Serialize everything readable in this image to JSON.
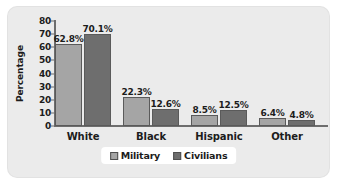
{
  "chart_data": {
    "type": "bar",
    "title": "",
    "xlabel": "",
    "ylabel": "Percentage",
    "ylim": [
      0,
      80
    ],
    "yticks": [
      80,
      70,
      60,
      50,
      40,
      30,
      20,
      10,
      0
    ],
    "grid": false,
    "legend_position": "bottom",
    "categories": [
      "White",
      "Black",
      "Hispanic",
      "Other"
    ],
    "series": [
      {
        "name": "Military",
        "color": "#a5a5a5",
        "values": [
          62.8,
          22.3,
          8.5,
          6.4
        ],
        "labels": [
          "62.8%",
          "22.3%",
          "8.5%",
          "6.4%"
        ]
      },
      {
        "name": "Civilians",
        "color": "#6e6e6e",
        "values": [
          70.1,
          12.6,
          12.5,
          4.8
        ],
        "labels": [
          "70.1%",
          "12.6%",
          "12.5%",
          "4.8%"
        ]
      }
    ]
  },
  "figure": {
    "background": "#ebebeb",
    "page_background": "#ffffff",
    "axis_color": "#6d6d6d"
  }
}
